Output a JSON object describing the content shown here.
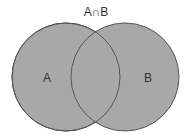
{
  "diagram": {
    "type": "venn",
    "title": "A∩B",
    "sets": [
      {
        "label": "A",
        "cx": 66,
        "cy": 77,
        "r": 54
      },
      {
        "label": "B",
        "cx": 125,
        "cy": 77,
        "r": 54
      }
    ],
    "colors": {
      "fill": "#a8a8a8",
      "stroke": "#555555",
      "text": "#333333"
    }
  }
}
